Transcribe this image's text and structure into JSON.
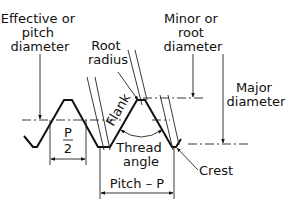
{
  "diagram": {
    "labels": {
      "effective_diameter": [
        "Effective or",
        "pitch",
        "diameter"
      ],
      "root_radius": [
        "Root",
        "radius"
      ],
      "minor_diameter": [
        "Minor or",
        "root",
        "diameter"
      ],
      "major_diameter": [
        "Major",
        "diameter"
      ],
      "flank": "Flank",
      "thread_angle": [
        "Thread",
        "angle"
      ],
      "crest": "Crest",
      "half_pitch_numerator": "P",
      "half_pitch_denominator": "2",
      "pitch": "Pitch – P"
    },
    "colors": {
      "line": "#111111",
      "background": "#ffffff"
    }
  }
}
